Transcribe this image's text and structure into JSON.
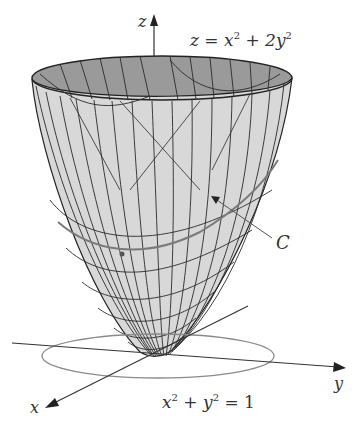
{
  "figure": {
    "surface_equation": {
      "lhs": "z",
      "op": " = ",
      "t1": "x",
      "e1": "2",
      "plus": " + ",
      "t2": "2y",
      "e2": "2"
    },
    "circle_equation": {
      "t1": "x",
      "e1": "2",
      "plus": " + ",
      "t2": "y",
      "e2": "2",
      "rhs": " = 1"
    },
    "axes": {
      "x": "x",
      "y": "y",
      "z": "z"
    },
    "curve_label": "C",
    "colors": {
      "surface_outer": "#d6d6d6",
      "surface_inner": "#9a9a9a",
      "mesh": "#2a2a2a",
      "curve": "#7a7a7a",
      "circle": "#8a8a8a",
      "axes": "#333333"
    }
  }
}
